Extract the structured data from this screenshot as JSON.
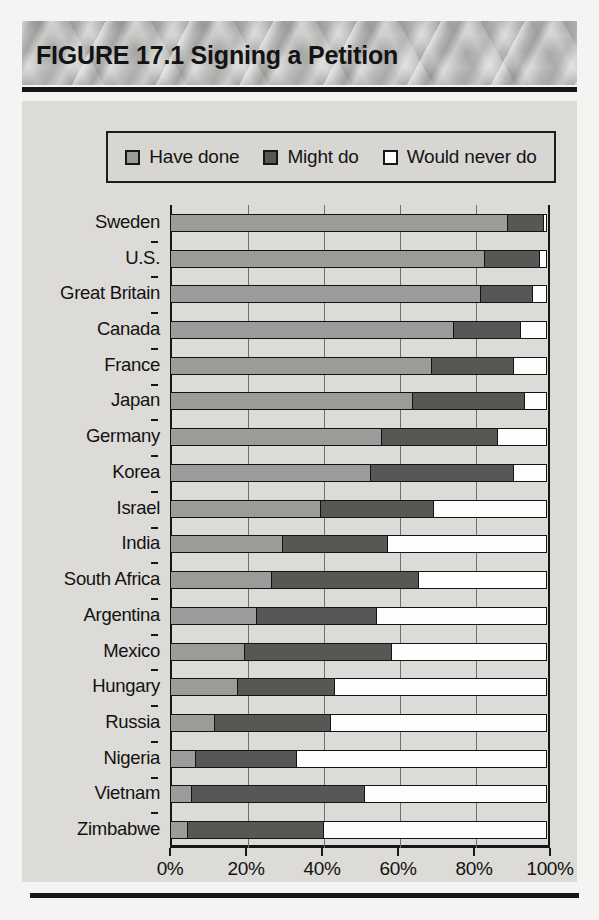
{
  "figure": {
    "title": "FIGURE 17.1  Signing a Petition"
  },
  "legend": {
    "items": [
      {
        "label": "Have done",
        "swatch": "light-gray-swatch-icon",
        "color": "#9b9b99"
      },
      {
        "label": "Might do",
        "swatch": "dark-gray-swatch-icon",
        "color": "#575756"
      },
      {
        "label": "Would never do",
        "swatch": "white-swatch-icon",
        "color": "#fdfdfd"
      }
    ]
  },
  "axis": {
    "x_ticks": [
      "0%",
      "20%",
      "40%",
      "60%",
      "80%",
      "100%"
    ]
  },
  "chart_data": {
    "type": "bar",
    "orientation": "horizontal",
    "stacked": true,
    "stacked_normalized": true,
    "title": "FIGURE 17.1  Signing a Petition",
    "xlabel": "",
    "ylabel": "",
    "xlim": [
      0,
      100
    ],
    "x_ticks": [
      0,
      20,
      40,
      60,
      80,
      100
    ],
    "x_tick_labels": [
      "0%",
      "20%",
      "40%",
      "60%",
      "80%",
      "100%"
    ],
    "grid": true,
    "legend_position": "top",
    "categories": [
      "Sweden",
      "U.S.",
      "Great Britain",
      "Canada",
      "France",
      "Japan",
      "Germany",
      "Korea",
      "Israel",
      "India",
      "South Africa",
      "Argentina",
      "Mexico",
      "Hungary",
      "Russia",
      "Nigeria",
      "Vietnam",
      "Zimbabwe"
    ],
    "series": [
      {
        "name": "Have done",
        "color": "#9b9b99",
        "values": [
          89,
          83,
          82,
          75,
          69,
          64,
          56,
          53,
          40,
          30,
          27,
          23,
          20,
          18,
          12,
          7,
          6,
          5
        ]
      },
      {
        "name": "Might do",
        "color": "#575756",
        "values": [
          10,
          15,
          14,
          18,
          22,
          30,
          31,
          38,
          30,
          28,
          39,
          32,
          39,
          26,
          31,
          27,
          46,
          36
        ]
      },
      {
        "name": "Would never do",
        "color": "#fdfdfd",
        "values": [
          1,
          2,
          4,
          7,
          9,
          6,
          13,
          9,
          30,
          42,
          34,
          45,
          41,
          56,
          57,
          66,
          48,
          59
        ]
      }
    ]
  }
}
